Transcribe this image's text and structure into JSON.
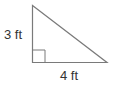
{
  "diagram": {
    "shape": "right-triangle",
    "labels": {
      "vertical_leg": "3 ft",
      "horizontal_leg": "4 ft"
    },
    "colors": {
      "stroke": "#7a7a7a",
      "text": "#333333"
    }
  }
}
